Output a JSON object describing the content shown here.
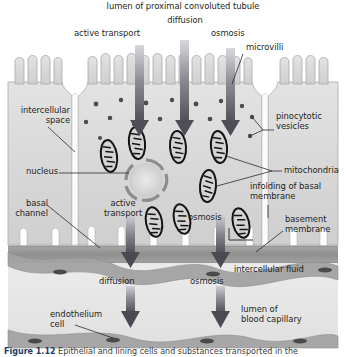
{
  "figure": {
    "type": "biological-diagram",
    "caption_prefix": "Figure",
    "caption_number": "1.12",
    "caption_text": "Epithelial and lining cells and substances transported in the",
    "background_color": "#ffffff",
    "cell_fill": "#dcdcdc",
    "cell_outline": "#9a9a9a",
    "arrow_color": "#5a5a60",
    "mitochondria_outline": "#1a1a1a",
    "basement_membrane_color": "#8e8e8e",
    "capillary_wall_color": "#9c9c9c",
    "leader_line_color": "#231f20"
  },
  "labels": {
    "lumen_tubule": "lumen of proximal convoluted tubule",
    "diffusion_top": "diffusion",
    "active_transport_top": "active transport",
    "osmosis_top": "osmosis",
    "microvilli": "microvilli",
    "intercellular_space": "intercellular\nspace",
    "pinocytotic_vesicles": "pinocytotic\nvesicles",
    "nucleus": "nucleus",
    "mitochondria": "mitochondria",
    "infolding_basal_membrane": "infolding of basal\nmembrane",
    "basal_channel": "basal\nchannel",
    "active_transport_lower": "active\ntransport",
    "osmosis_lower": "osmosis",
    "basement_membrane": "basement\nmembrane",
    "diffusion_bottom": "diffusion",
    "osmosis_bottom": "osmosis",
    "intercellular_fluid": "intercellular fluid",
    "endothelium_cell": "endothelium\ncell",
    "lumen_blood_capillary": "lumen of\nblood capillary"
  },
  "structures": {
    "microvilli_count_center": 9,
    "microvilli_count_left": 4,
    "microvilli_count_right": 4,
    "mitochondria_count": 8,
    "vesicle_count": 16,
    "basal_infolding_count": 6,
    "endothelium_nuclei_count": 5,
    "top_arrow_count": 3,
    "bottom_arrow_count": 2,
    "capillary_arrow_count": 2
  }
}
